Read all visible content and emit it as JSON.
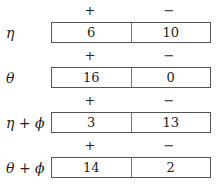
{
  "headers": {
    "plus": "+",
    "minus": "−"
  },
  "rows": [
    {
      "label": "η",
      "plus": "6",
      "minus": "10"
    },
    {
      "label": "θ",
      "plus": "16",
      "minus": "0"
    },
    {
      "label": "η + ϕ",
      "plus": "3",
      "minus": "13"
    },
    {
      "label": "θ + ϕ",
      "plus": "14",
      "minus": "2"
    }
  ]
}
